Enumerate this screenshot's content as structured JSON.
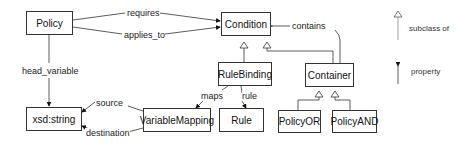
{
  "diagram": {
    "classes": [
      {
        "id": "policy",
        "label": "Policy"
      },
      {
        "id": "condition",
        "label": "Condition"
      },
      {
        "id": "rulebinding",
        "label": "RuleBinding"
      },
      {
        "id": "container",
        "label": "Container"
      },
      {
        "id": "xsdstring",
        "label": "xsd:string"
      },
      {
        "id": "variablemapping",
        "label": "VariableMapping"
      },
      {
        "id": "rule",
        "label": "Rule"
      },
      {
        "id": "policyor",
        "label": "PolicyOR"
      },
      {
        "id": "policyand",
        "label": "PolicyAND"
      }
    ],
    "properties": [
      {
        "label": "requires",
        "from": "Policy",
        "to": "Condition"
      },
      {
        "label": "applies_to",
        "from": "Policy",
        "to": "Condition"
      },
      {
        "label": "contains",
        "from": "Container",
        "to": "Condition"
      },
      {
        "label": "head_variable",
        "from": "Policy",
        "to": "xsd:string"
      },
      {
        "label": "maps",
        "from": "RuleBinding",
        "to": "VariableMapping"
      },
      {
        "label": "rule",
        "from": "RuleBinding",
        "to": "Rule"
      },
      {
        "label": "source",
        "from": "VariableMapping",
        "to": "xsd:string"
      },
      {
        "label": "destination",
        "from": "VariableMapping",
        "to": "xsd:string"
      }
    ],
    "subclasses": [
      {
        "child": "RuleBinding",
        "parent": "Condition"
      },
      {
        "child": "Container",
        "parent": "Condition"
      },
      {
        "child": "PolicyOR",
        "parent": "Container"
      },
      {
        "child": "PolicyAND",
        "parent": "Container"
      }
    ]
  },
  "legend": {
    "subclass": "subclass of",
    "property": "property"
  }
}
